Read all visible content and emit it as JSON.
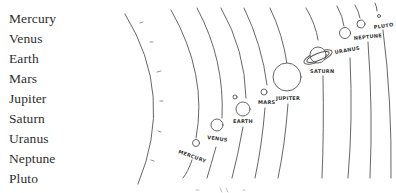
{
  "planet_list": {
    "items": [
      {
        "label": "Mercury"
      },
      {
        "label": "Venus"
      },
      {
        "label": "Earth"
      },
      {
        "label": "Mars"
      },
      {
        "label": "Jupiter"
      },
      {
        "label": "Saturn"
      },
      {
        "label": "Uranus"
      },
      {
        "label": "Neptune"
      },
      {
        "label": "Pluto"
      }
    ]
  },
  "diagram": {
    "planet_labels": {
      "mercury": "MERCURY",
      "venus": "VENUS",
      "earth": "EARTH",
      "mars": "MARS",
      "jupiter": "JUPITER",
      "saturn": "SATURN",
      "uranus": "URANUS",
      "neptune": "NEPTUNE",
      "pluto": "PLUTO"
    },
    "stroke_color": "#555555",
    "background_color": "#ffffff"
  }
}
